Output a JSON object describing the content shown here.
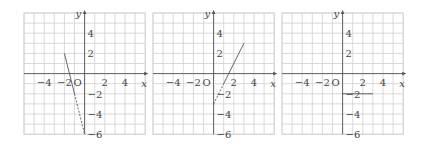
{
  "panels": [
    {
      "id": "graph-1",
      "origin_label": "O",
      "x_axis_label": "x",
      "y_axis_label": "y",
      "x_ticks": [
        "-4",
        "-2",
        "2",
        "4"
      ],
      "y_ticks": [
        "4",
        "2",
        "-2",
        "-4",
        "-6"
      ],
      "segments": [
        {
          "from": [
            -2,
            2
          ],
          "to": [
            -1,
            -2
          ],
          "style": "solid"
        },
        {
          "from": [
            -1,
            -2
          ],
          "to": [
            0,
            -6
          ],
          "style": "dashed"
        }
      ]
    },
    {
      "id": "graph-2",
      "origin_label": "O",
      "x_axis_label": "x",
      "y_axis_label": "y",
      "x_ticks": [
        "-4",
        "-2",
        "2",
        "4"
      ],
      "y_ticks": [
        "4",
        "2",
        "-2",
        "-4",
        "-6"
      ],
      "segments": [
        {
          "from": [
            1,
            -1
          ],
          "to": [
            3,
            3
          ],
          "style": "solid"
        },
        {
          "from": [
            0,
            -3
          ],
          "to": [
            1,
            -1
          ],
          "style": "dashed"
        }
      ]
    },
    {
      "id": "graph-3",
      "origin_label": "O",
      "x_axis_label": "x",
      "y_axis_label": "y",
      "x_ticks": [
        "-4",
        "-2",
        "2",
        "4"
      ],
      "y_ticks": [
        "4",
        "2",
        "-2",
        "-4",
        "-6"
      ],
      "segments": [
        {
          "from": [
            0,
            -2
          ],
          "to": [
            3,
            -2
          ],
          "style": "solid"
        }
      ]
    }
  ],
  "grid": {
    "xmin": -6,
    "xmax": 6,
    "ymin": -6,
    "ymax": 6,
    "unit_px": 10.1
  },
  "colors": {
    "grid": "#cfcfcf",
    "axis": "#555555",
    "text": "#444444"
  }
}
